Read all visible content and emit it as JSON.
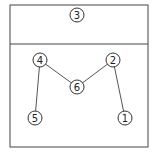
{
  "diagram": {
    "top_region": {
      "label": "3",
      "x": 77,
      "y": 15
    },
    "nodes": [
      {
        "id": "1",
        "label": "1",
        "x": 125,
        "y": 118
      },
      {
        "id": "2",
        "label": "2",
        "x": 113,
        "y": 60
      },
      {
        "id": "4",
        "label": "4",
        "x": 40,
        "y": 60
      },
      {
        "id": "5",
        "label": "5",
        "x": 35,
        "y": 118
      },
      {
        "id": "6",
        "label": "6",
        "x": 77,
        "y": 87
      }
    ],
    "edges": [
      [
        "5",
        "4"
      ],
      [
        "4",
        "6"
      ],
      [
        "6",
        "2"
      ],
      [
        "2",
        "1"
      ]
    ],
    "colors": {
      "line": "#555555",
      "frame": "#444444"
    }
  }
}
